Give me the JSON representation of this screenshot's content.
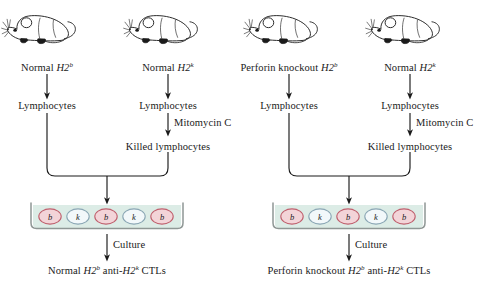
{
  "figure": {
    "panels": [
      {
        "id": "left-panel",
        "responder": {
          "mouse_icon": "mouse-icon",
          "label_text": "Normal H2",
          "label_prefix": "Normal ",
          "label_gene": "H2",
          "label_sup": "b"
        },
        "stimulator": {
          "mouse_icon": "mouse-icon",
          "label_prefix": "Normal ",
          "label_gene": "H2",
          "label_sup": "k"
        },
        "responder_product": "Lymphocytes",
        "stimulator_product": "Lymphocytes",
        "treatment": "Mitomycin C",
        "treated_product": "Killed lymphocytes",
        "culture_label": "Culture",
        "cells": [
          {
            "allele": "b",
            "type": "responder"
          },
          {
            "allele": "k",
            "type": "stimulator"
          },
          {
            "allele": "b",
            "type": "responder"
          },
          {
            "allele": "k",
            "type": "stimulator"
          },
          {
            "allele": "b",
            "type": "responder"
          }
        ],
        "outcome_prefix": "Normal ",
        "outcome_gene1": "H2",
        "outcome_sup1": "b",
        "outcome_mid": " anti-",
        "outcome_gene2": "H2",
        "outcome_sup2": "k",
        "outcome_suffix": " CTLs"
      },
      {
        "id": "right-panel",
        "responder": {
          "mouse_icon": "mouse-icon",
          "label_prefix": "Perforin knockout ",
          "label_gene": "H2",
          "label_sup": "b"
        },
        "stimulator": {
          "mouse_icon": "mouse-icon",
          "label_prefix": "Normal ",
          "label_gene": "H2",
          "label_sup": "k"
        },
        "responder_product": "Lymphocytes",
        "stimulator_product": "Lymphocytes",
        "treatment": "Mitomycin C",
        "treated_product": "Killed lymphocytes",
        "culture_label": "Culture",
        "cells": [
          {
            "allele": "b",
            "type": "responder"
          },
          {
            "allele": "k",
            "type": "stimulator"
          },
          {
            "allele": "b",
            "type": "responder"
          },
          {
            "allele": "k",
            "type": "stimulator"
          },
          {
            "allele": "b",
            "type": "responder"
          }
        ],
        "outcome_prefix": "Perforin knockout ",
        "outcome_gene1": "H2",
        "outcome_sup1": "b",
        "outcome_mid": " anti-",
        "outcome_gene2": "H2",
        "outcome_sup2": "k",
        "outcome_suffix": " CTLs"
      }
    ],
    "colors": {
      "b_cell_fill": "#f3d4d8",
      "b_cell_stroke": "#c0606e",
      "k_cell_fill": "#f2f8fa",
      "k_cell_stroke": "#8aa6b4",
      "medium_fill": "#dcece6",
      "vessel_stroke": "#8f9795",
      "arrow": "#1a1a1a",
      "background": "#ffffff",
      "text": "#1a1a1a"
    }
  }
}
